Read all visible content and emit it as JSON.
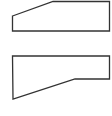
{
  "canvas": {
    "width": 112,
    "height": 116,
    "background": "#ffffff"
  },
  "shapes": [
    {
      "name": "top-shape",
      "points": "12.5,16 53,1.5 109.5,1.5 109.5,31 12.5,31",
      "stroke": "#333333",
      "stroke_width": 1.3,
      "fill": "#ffffff"
    },
    {
      "name": "bottom-shape",
      "points": "12.5,56 109.5,56 109.5,79 75,79 13,99",
      "stroke": "#333333",
      "stroke_width": 1.3,
      "fill": "#ffffff"
    }
  ]
}
